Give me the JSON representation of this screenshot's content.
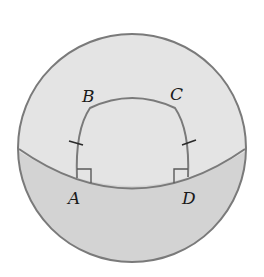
{
  "diagram": {
    "colors": {
      "background": "#ffffff",
      "sphere_upper": "#e4e4e4",
      "sphere_lower": "#d2d2d2",
      "stroke": "#7a7a7a",
      "label": "#1a1a1a"
    },
    "labels": {
      "A": "A",
      "B": "B",
      "C": "C",
      "D": "D"
    },
    "marks": {
      "congruent_sides": [
        "AB",
        "CD"
      ],
      "right_angles": [
        "A",
        "D"
      ]
    }
  }
}
